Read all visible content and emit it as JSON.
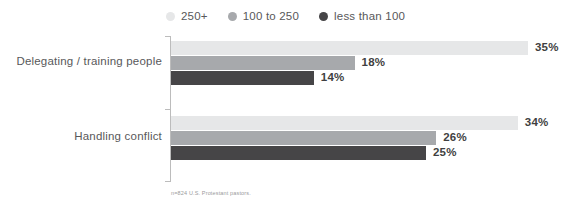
{
  "chart_data": {
    "type": "bar",
    "orientation": "horizontal",
    "title": "",
    "subtitle": "",
    "xlabel": "",
    "ylabel": "",
    "grid": false,
    "legend_position": "top",
    "xlim": [
      0,
      39
    ],
    "value_suffix": "%",
    "categories": [
      "Delegating / training people",
      "Handling conflict"
    ],
    "series": [
      {
        "name": "250+",
        "color": "#e6e7e8",
        "values": [
          35,
          34
        ],
        "labels": [
          "35%",
          "34%"
        ]
      },
      {
        "name": "100 to 250",
        "color": "#a7a9ac",
        "values": [
          18,
          26
        ],
        "labels": [
          "18%",
          "26%"
        ]
      },
      {
        "name": "less than 100",
        "color": "#464547",
        "values": [
          14,
          25
        ],
        "labels": [
          "14%",
          "25%"
        ]
      }
    ],
    "annotations": [
      "n=824 U.S. Protestant pastors."
    ]
  },
  "legend": {
    "items": [
      {
        "label": "250+",
        "color": "#e6e7e8"
      },
      {
        "label": "100 to 250",
        "color": "#a7a9ac"
      },
      {
        "label": "less than 100",
        "color": "#464547"
      }
    ]
  },
  "groups": [
    {
      "label": "Delegating / training people",
      "bars": [
        {
          "series": "250+",
          "value": 35,
          "label": "35%",
          "color": "#e6e7e8"
        },
        {
          "series": "100 to 250",
          "value": 18,
          "label": "18%",
          "color": "#a7a9ac"
        },
        {
          "series": "less than 100",
          "value": 14,
          "label": "14%",
          "color": "#464547"
        }
      ]
    },
    {
      "label": "Handling conflict",
      "bars": [
        {
          "series": "250+",
          "value": 34,
          "label": "34%",
          "color": "#e6e7e8"
        },
        {
          "series": "100 to 250",
          "value": 26,
          "label": "26%",
          "color": "#a7a9ac"
        },
        {
          "series": "less than 100",
          "value": 25,
          "label": "25%",
          "color": "#464547"
        }
      ]
    }
  ],
  "footnote": "n=824 U.S. Protestant pastors.",
  "scale": {
    "px_per_percent": 10.2
  },
  "colors": {
    "label_text": "#58585a",
    "value_text": "#3f3f41",
    "axis": "#bcbcbc",
    "footnote_text": "#9a9a9c",
    "background": "#ffffff"
  }
}
